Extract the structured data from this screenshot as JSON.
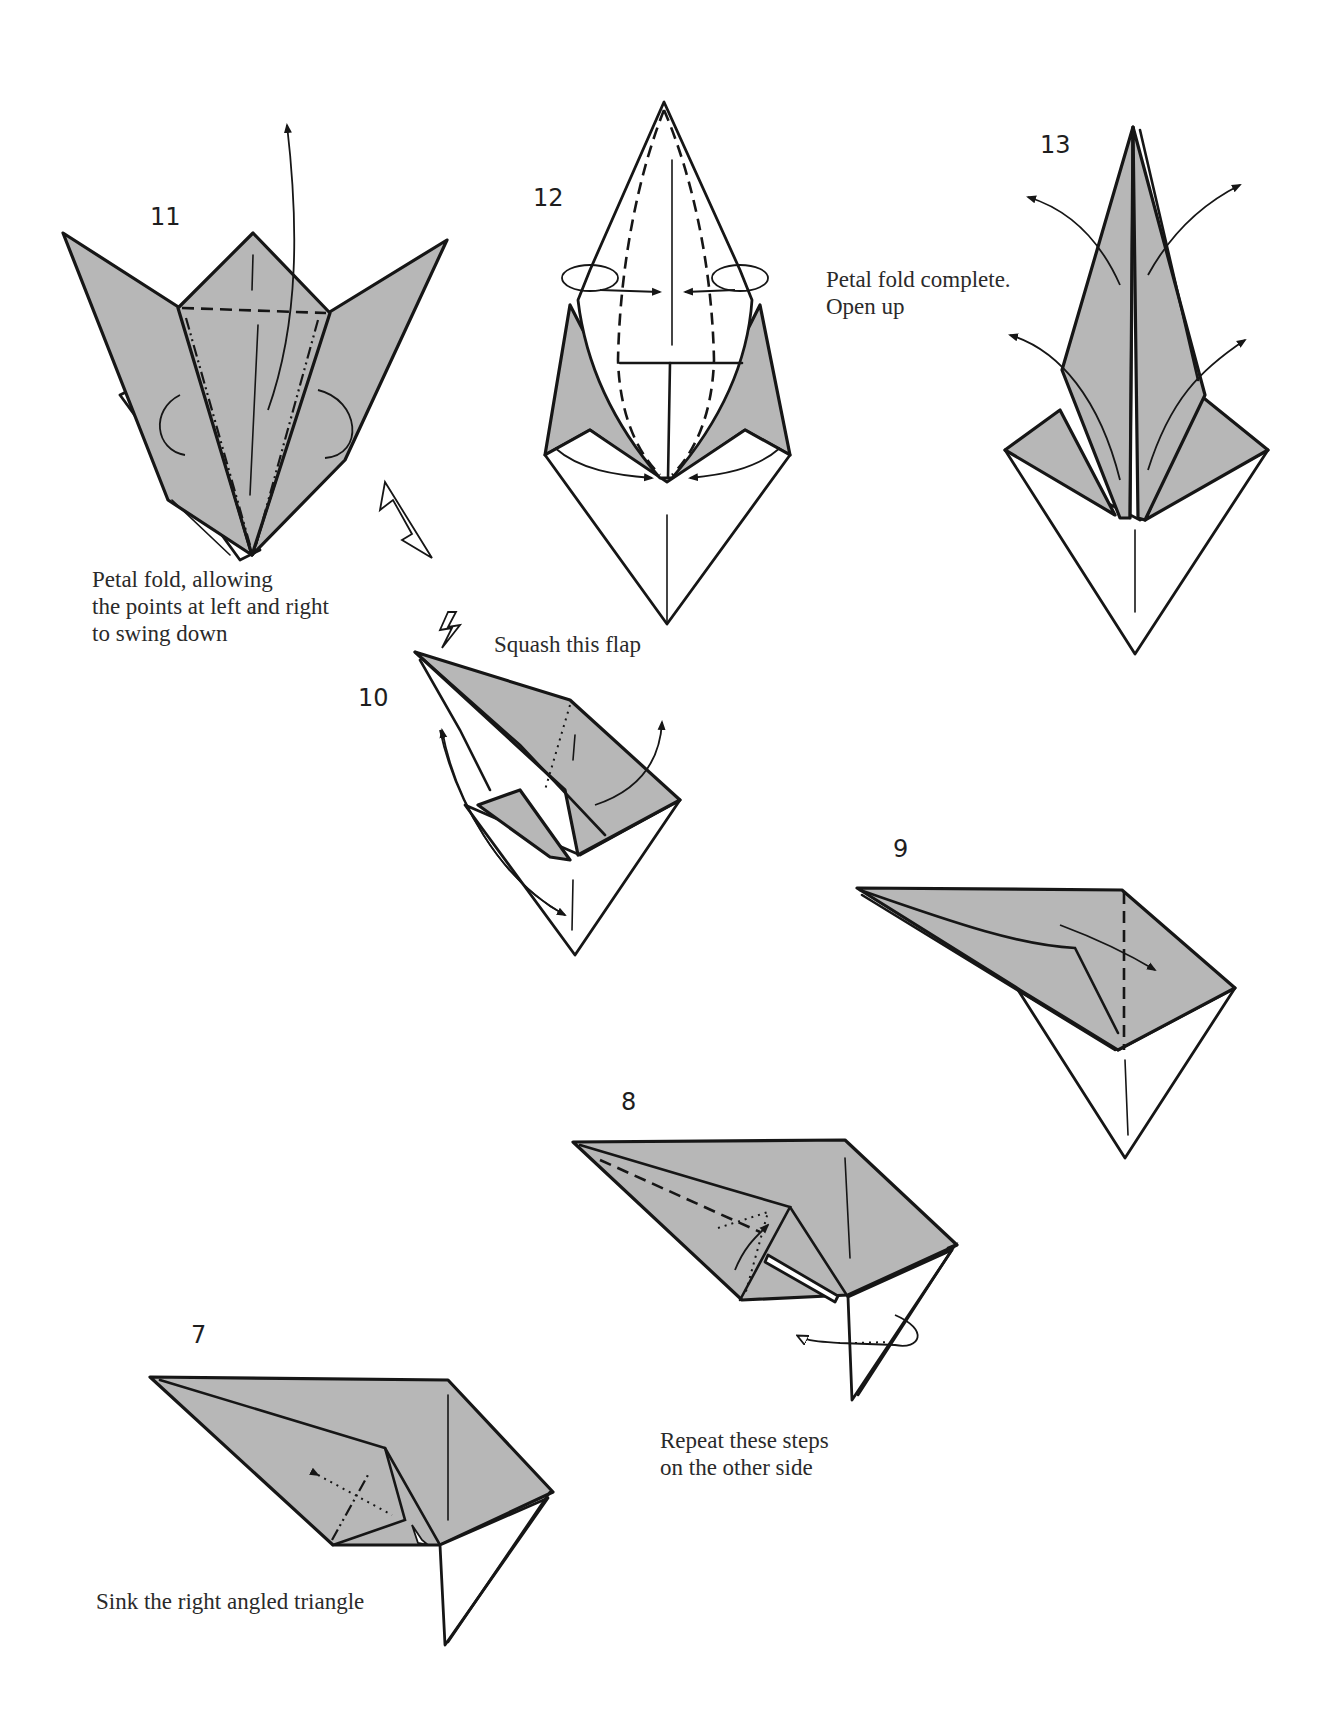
{
  "page": {
    "background": "#ffffff",
    "paper_color": "#b7b7b7",
    "line_color": "#161616"
  },
  "steps": [
    {
      "number": "11",
      "caption": [
        "Petal fold, allowing",
        "the points at left and right",
        "to swing down"
      ]
    },
    {
      "number": "12",
      "caption": []
    },
    {
      "number": "13",
      "caption": [
        "Petal fold complete.",
        "Open up"
      ]
    },
    {
      "number": "10",
      "caption": [
        "Squash this flap"
      ]
    },
    {
      "number": "9",
      "caption": []
    },
    {
      "number": "8",
      "caption": [
        "Repeat these steps",
        "on the other side"
      ]
    },
    {
      "number": "7",
      "caption": [
        "Sink the right angled triangle"
      ]
    }
  ],
  "icons": {
    "step11": [
      "push-arrow-icon",
      "fold-up-arrow-icon",
      "turn-over-arrow-icon"
    ],
    "step10": [
      "squash-arrow-icon",
      "swing-arrow-icon"
    ],
    "step12": [
      "open-arrow-icon"
    ],
    "step13": [
      "open-out-arrow-icon"
    ],
    "step9": [
      "fold-over-arrow-icon"
    ],
    "step8": [
      "repeat-behind-arrow-icon"
    ],
    "step7": [
      "sink-arrow-icon"
    ]
  }
}
